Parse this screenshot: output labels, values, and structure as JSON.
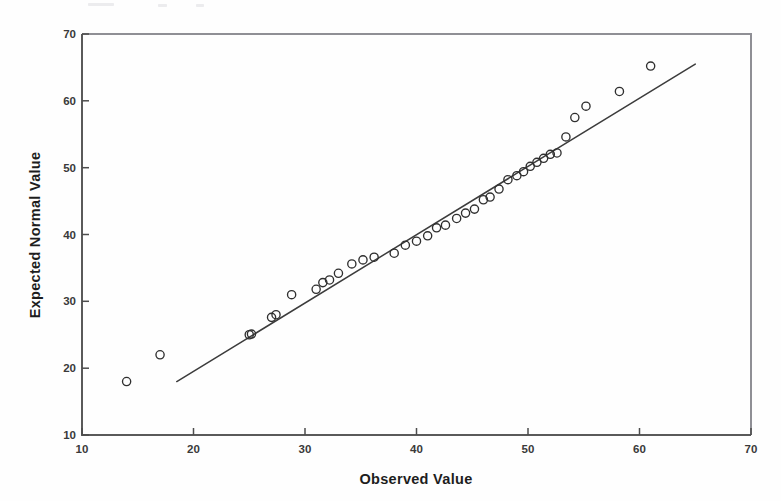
{
  "figure": {
    "kind": "qq-plot",
    "background_color": "#fefefe",
    "marker_color": "#2f2f2f",
    "line_color": "#3c3c3c",
    "axis_color": "#5a5a5a"
  },
  "axis": {
    "x_title": "Observed Value",
    "y_title": "Expected Normal Value",
    "x_ticks": [
      "10",
      "20",
      "30",
      "40",
      "50",
      "60",
      "70"
    ],
    "y_ticks": [
      "70",
      "60",
      "50",
      "40",
      "30",
      "20",
      "10"
    ]
  },
  "chart_data": {
    "type": "scatter",
    "title": "",
    "subtitle": "",
    "xlabel": "Observed Value",
    "ylabel": "Expected Normal Value",
    "xlim": [
      10,
      70
    ],
    "ylim": [
      10,
      70
    ],
    "xticks": [
      10,
      20,
      30,
      40,
      50,
      60,
      70
    ],
    "yticks": [
      10,
      20,
      30,
      40,
      50,
      60,
      70
    ],
    "grid": false,
    "legend": null,
    "legend_position": "none",
    "marker": "open-circle",
    "series": [
      {
        "name": "Expected Normal Value vs Observed Value",
        "x": [
          14.0,
          17.0,
          25.0,
          25.2,
          27.0,
          27.4,
          28.8,
          31.0,
          31.6,
          32.2,
          33.0,
          34.2,
          35.2,
          36.2,
          38.0,
          39.0,
          40.0,
          41.0,
          41.8,
          42.6,
          43.6,
          44.4,
          45.2,
          46.0,
          46.6,
          47.4,
          48.2,
          49.0,
          49.6,
          50.2,
          50.8,
          51.4,
          52.0,
          52.6,
          53.4,
          54.2,
          55.2,
          58.2,
          61.0
        ],
        "y": [
          18.0,
          22.0,
          25.0,
          25.1,
          27.6,
          28.0,
          31.0,
          31.8,
          32.8,
          33.2,
          34.2,
          35.6,
          36.2,
          36.6,
          37.2,
          38.4,
          39.0,
          39.8,
          41.0,
          41.4,
          42.4,
          43.2,
          43.8,
          45.2,
          45.6,
          46.8,
          48.2,
          48.8,
          49.4,
          50.2,
          50.8,
          51.4,
          52.0,
          52.2,
          54.6,
          57.5,
          59.2,
          61.4,
          65.2
        ]
      }
    ],
    "reference_line": {
      "name": "normal reference line",
      "x": [
        18.5,
        65.0
      ],
      "y": [
        18.0,
        65.5
      ]
    }
  }
}
